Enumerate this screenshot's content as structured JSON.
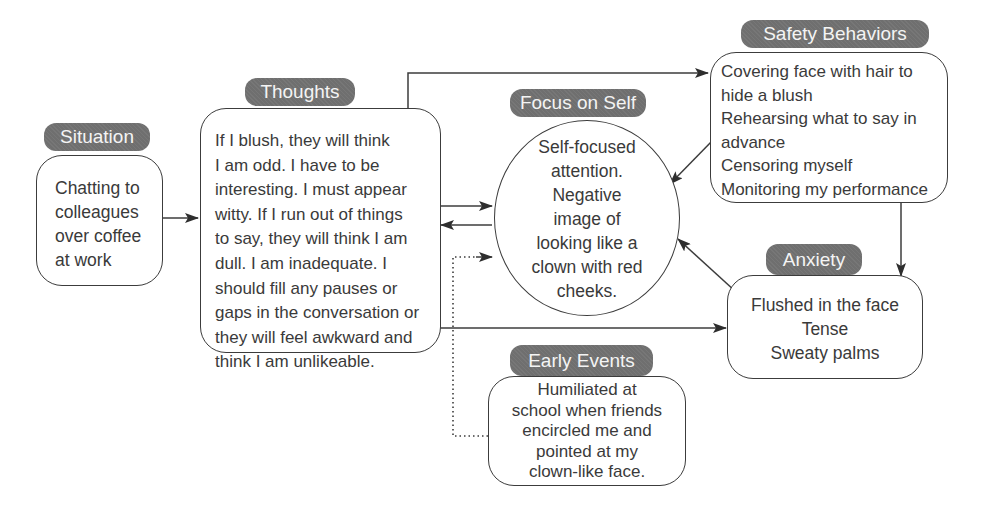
{
  "diagram": {
    "nodes": {
      "situation": {
        "label": "Situation",
        "lines": [
          "Chatting to",
          "colleagues",
          "over coffee",
          "at work"
        ]
      },
      "thoughts": {
        "label": "Thoughts",
        "lines": [
          "If I blush, they will think",
          "I am odd. I have to be",
          "interesting. I must appear",
          "witty. If I run out of things",
          "to say, they will think I am",
          "dull. I am inadequate. I",
          "should fill any pauses or",
          "gaps in the conversation or",
          "they will feel awkward and",
          "think I am unlikeable."
        ]
      },
      "focus_on_self": {
        "label": "Focus on Self",
        "lines": [
          "Self-focused",
          "attention.",
          "Negative",
          "image of",
          "looking like a",
          "clown with red",
          "cheeks."
        ]
      },
      "safety_behaviors": {
        "label": "Safety Behaviors",
        "lines": [
          "Covering face with hair to",
          "hide a blush",
          "Rehearsing what to say in",
          "advance",
          "Censoring myself",
          "Monitoring my performance"
        ]
      },
      "anxiety": {
        "label": "Anxiety",
        "lines": [
          "Flushed in the face",
          "Tense",
          "Sweaty palms"
        ]
      },
      "early_events": {
        "label": "Early Events",
        "lines": [
          "Humiliated at",
          "school when friends",
          "encircled me and",
          "pointed at my",
          "clown-like face."
        ]
      }
    },
    "edges": [
      {
        "from": "situation",
        "to": "thoughts",
        "style": "solid"
      },
      {
        "from": "thoughts",
        "to": "safety_behaviors",
        "style": "solid"
      },
      {
        "from": "thoughts",
        "to": "focus_on_self",
        "style": "solid"
      },
      {
        "from": "focus_on_self",
        "to": "thoughts",
        "style": "solid"
      },
      {
        "from": "thoughts",
        "to": "anxiety",
        "style": "solid"
      },
      {
        "from": "safety_behaviors",
        "to": "focus_on_self",
        "style": "solid"
      },
      {
        "from": "safety_behaviors",
        "to": "anxiety",
        "style": "solid"
      },
      {
        "from": "anxiety",
        "to": "focus_on_self",
        "style": "solid"
      },
      {
        "from": "early_events",
        "to": "focus_on_self",
        "style": "dotted"
      }
    ],
    "colors": {
      "pill_fill": "#6f6f6f",
      "pill_text": "#f4f4f4",
      "stroke": "#3c3c3c",
      "text": "#3a3a3a",
      "background": "#ffffff"
    }
  }
}
